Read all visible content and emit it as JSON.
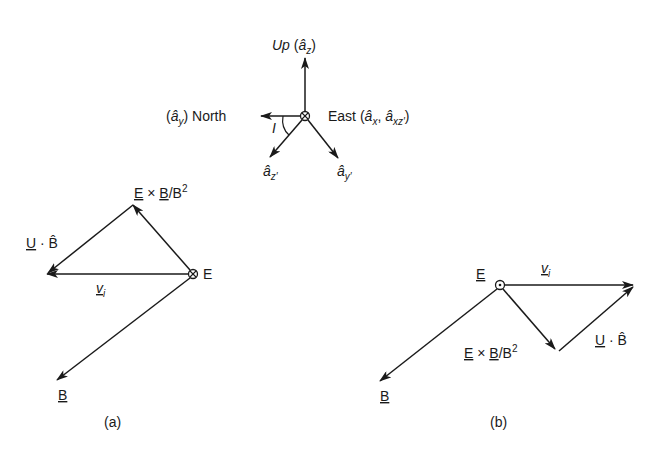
{
  "figure": {
    "axes_diagram": {
      "up_label": "Up",
      "up_unit": "â",
      "up_sub": "z",
      "north_label": "North",
      "north_unit": "â",
      "north_sub": "y",
      "east_label": "East",
      "east_unit1": "â",
      "east_sub1": "x",
      "east_unit2": "â",
      "east_sub2": "xz′",
      "angle_label": "I",
      "zprime_unit": "â",
      "zprime_sub": "z′",
      "yprime_unit": "â",
      "yprime_sub": "y′",
      "center_symbol": "cross-in-circle"
    },
    "panel_a": {
      "caption": "(a)",
      "exb_label_E": "E",
      "exb_label_times": " × ",
      "exb_label_B": "B",
      "exb_label_rest": "/B",
      "exb_label_sup": "2",
      "ub_label_U": "U",
      "ub_label_rest": " · B̂",
      "vi_label": "v",
      "vi_sub": "i",
      "e_label": "E",
      "b_label": "B",
      "center_symbol": "cross-in-circle"
    },
    "panel_b": {
      "caption": "(b)",
      "e_label": "E",
      "vi_label": "v",
      "vi_sub": "i",
      "exb_label_E": "E",
      "exb_label_times": " × ",
      "exb_label_B": "B",
      "exb_label_rest": "/B",
      "exb_label_sup": "2",
      "ub_label_U": "U",
      "ub_label_rest": " · B̂",
      "b_label": "B",
      "center_symbol": "dot-in-circle"
    }
  }
}
